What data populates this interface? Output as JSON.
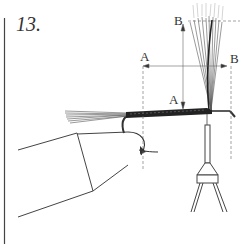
{
  "figure": {
    "step_number": "13.",
    "labels": {
      "a_top": "A",
      "a_bottom": "A",
      "b_top": "B",
      "b_right": "B"
    },
    "elements": [
      "vise-jaws",
      "hook",
      "tail-fibers",
      "thread-wrapped-body",
      "upright-wing-fibers",
      "bobbin-holder",
      "dimension-line-a",
      "dimension-line-b"
    ],
    "colors": {
      "ink": "#333333",
      "background": "#ffffff",
      "guide": "#999999"
    }
  }
}
